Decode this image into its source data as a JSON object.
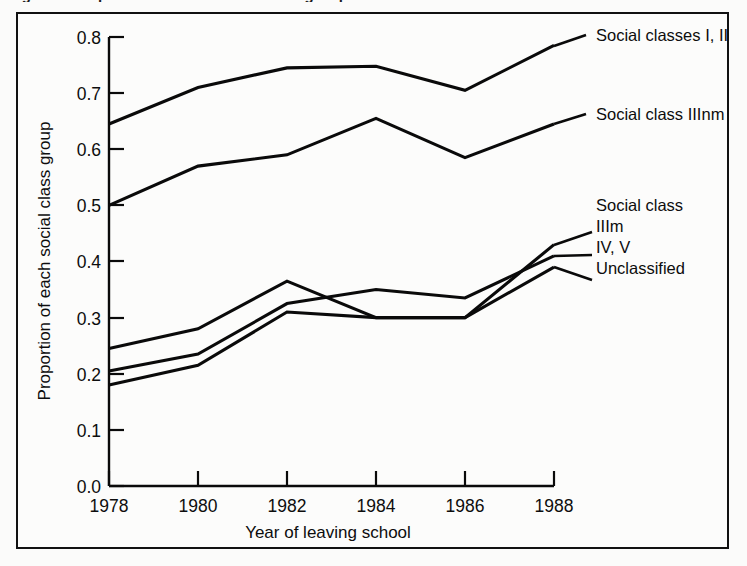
{
  "figure": {
    "title_remnant": "Figure 3  Proportion of each social class group",
    "frame_border_color": "#111111",
    "background_color": "#fcfcfb"
  },
  "chart_data": {
    "type": "line",
    "title": "",
    "xlabel": "Year of leaving school",
    "ylabel": "Proportion of each social class group",
    "x": [
      1978,
      1980,
      1982,
      1984,
      1986,
      1988
    ],
    "categories": [
      "1978",
      "1980",
      "1982",
      "1984",
      "1986",
      "1988"
    ],
    "xlim": [
      1978,
      1988
    ],
    "ylim": [
      0.0,
      0.8
    ],
    "yticks": [
      "0.0",
      "0.1",
      "0.2",
      "0.3",
      "0.4",
      "0.5",
      "0.6",
      "0.7",
      "0.8"
    ],
    "ytick_values": [
      0.0,
      0.1,
      0.2,
      0.3,
      0.4,
      0.5,
      0.6,
      0.7,
      0.8
    ],
    "grid": false,
    "legend_position": "right-inline-annotations",
    "line_color": "#0a0a0a",
    "series": [
      {
        "name": "Social classes I, II",
        "values": [
          0.645,
          0.71,
          0.745,
          0.748,
          0.705,
          0.785
        ]
      },
      {
        "name": "Social class IIInm",
        "values": [
          0.5,
          0.57,
          0.59,
          0.655,
          0.585,
          0.645
        ]
      },
      {
        "name": "IIIm",
        "values": [
          0.245,
          0.28,
          0.365,
          0.3,
          0.3,
          0.43
        ]
      },
      {
        "name": "IV, V",
        "values": [
          0.205,
          0.235,
          0.325,
          0.35,
          0.335,
          0.41
        ]
      },
      {
        "name": "Unclassified",
        "values": [
          0.18,
          0.215,
          0.31,
          0.3,
          0.3,
          0.39
        ]
      }
    ],
    "annotations": [
      {
        "text": "Social classes I, II",
        "target_series": "Social classes I, II"
      },
      {
        "text": "Social class IIInm",
        "target_series": "Social class IIInm"
      },
      {
        "text": "Social class",
        "target_series": ""
      },
      {
        "text": "IIIm",
        "target_series": "IIIm"
      },
      {
        "text": "IV, V",
        "target_series": "IV, V"
      },
      {
        "text": "Unclassified",
        "target_series": "Unclassified"
      }
    ]
  }
}
